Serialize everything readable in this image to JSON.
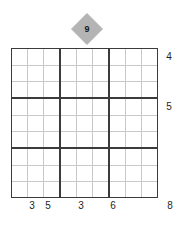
{
  "puzzle": {
    "type": "sudoku-like-grid-puzzle",
    "grid": {
      "rows": 9,
      "columns": 9,
      "block_rows": 3,
      "block_columns": 3,
      "cells_empty": true,
      "thin_line_color": "#c9c9c9",
      "thick_line_color": "#3b3b3b",
      "background_color": "#ffffff"
    },
    "marker": {
      "icon": "diamond-marker-icon",
      "value": "9",
      "fill_color": "#b4b4b4",
      "text_color": "#1a1a1a",
      "points_to_column": 5,
      "position": "above-grid"
    },
    "column_labels": [
      {
        "column": 2,
        "value": "3"
      },
      {
        "column": 3,
        "value": "5"
      },
      {
        "column": 5,
        "value": "3"
      },
      {
        "column": 7,
        "value": "6"
      },
      {
        "column": 9,
        "value": "8"
      }
    ],
    "row_labels": [
      {
        "row": 1,
        "value": "4"
      },
      {
        "row": 4,
        "value": "5"
      },
      {
        "row": 9,
        "value": "8"
      }
    ],
    "bottom_labels_text": "3 5 3 6 8",
    "right_labels_text": "4 5"
  }
}
